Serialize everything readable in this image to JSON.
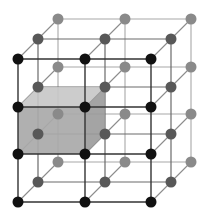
{
  "diagram": {
    "title": "",
    "type": "3d-lattice",
    "grid": {
      "columns_x": [
        18,
        85,
        151
      ],
      "rows_y": [
        59,
        107,
        154,
        202
      ],
      "depth_offsets": [
        [
          0,
          0
        ],
        [
          20,
          -20
        ],
        [
          40,
          -40
        ]
      ]
    },
    "node_radius": 5.5,
    "colors": {
      "background": "#ffffff",
      "node_front": "#111111",
      "node_middle": "#585858",
      "node_back": "#8a8a8a",
      "edge_front": "#333333",
      "edge_middle": "#6a6a6a",
      "edge_back": "#a8a8a8",
      "edge_depth": "#8c8c8c",
      "cube_front": "#a9a9a9",
      "cube_top": "#c6c6c6",
      "cube_side": "#9a9a9a"
    },
    "highlighted_cell": {
      "col": 0,
      "row": 1,
      "depth": 0
    }
  }
}
